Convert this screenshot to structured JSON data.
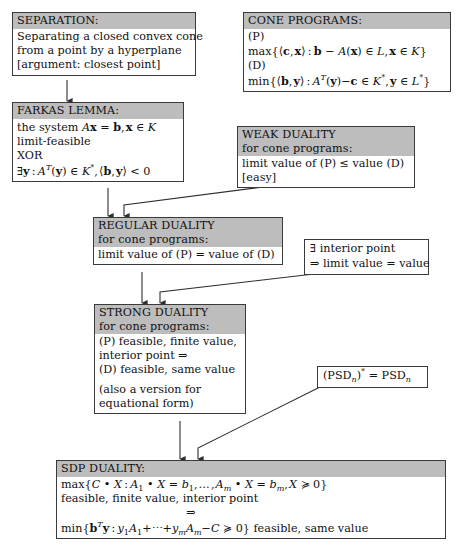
{
  "diagram": {
    "box_fill": "#ffffff",
    "header_fill": "#bdbdbd",
    "border_color": "#3a3a3a"
  },
  "boxes": {
    "separation": {
      "header": "SEPARATION:",
      "lines": [
        "Separating a closed convex cone",
        "from a point by a hyperplane",
        "[argument: closest point]"
      ]
    },
    "cone_programs": {
      "header": "CONE PROGRAMS:",
      "lines": [
        "(P)",
        "max{⟨c, x⟩ : b − A(x) ∈ L, x ∈ K}",
        "(D)",
        "min{⟨b, y⟩ : A^T(y)−c ∈ K*, y ∈ L*}"
      ]
    },
    "farkas": {
      "header": "FARKAS LEMMA:",
      "lines": [
        "the system Ax = b, x ∈ K",
        "limit-feasible",
        "XOR",
        "∃y : A^T(y) ∈ K*, ⟨b, y⟩ < 0"
      ]
    },
    "weak_duality": {
      "header_line1": "WEAK DUALITY",
      "header_line2": "for cone programs:",
      "lines": [
        "limit value of (P) ≤ value (D)",
        "[easy]"
      ]
    },
    "regular_duality": {
      "header_line1": "REGULAR DUALITY",
      "header_line2": "for cone programs:",
      "lines": [
        "limit value of (P) = value of (D)"
      ]
    },
    "interior_point": {
      "lines": [
        "∃ interior point",
        "⇒ limit value = value"
      ]
    },
    "strong_duality": {
      "header_line1": "STRONG DUALITY",
      "header_line2": "for cone programs:",
      "lines": [
        "(P) feasible, finite value,",
        "interior point ⇒",
        "(D) feasible, same value",
        "",
        "(also a version for",
        "equational form)"
      ]
    },
    "psd_selfdual": {
      "lines": [
        "(PSD_n)* = PSD_n"
      ]
    },
    "sdp_duality": {
      "header": "SDP DUALITY:",
      "lines": [
        "max{C • X : A_1 • X = b_1, …, A_m • X = b_m, X ⪰ 0}",
        "feasible, finite value, interior point",
        "⇒",
        "min{b^T y : y_1 A_1 + ⋯ + y_m A_m − C ⪰ 0} feasible, same value"
      ]
    }
  },
  "edges": [
    {
      "name": "separation-to-farkas",
      "from": "separation",
      "to": "farkas"
    },
    {
      "name": "farkas-to-regular",
      "from": "farkas",
      "to": "regular_duality"
    },
    {
      "name": "weak-to-regular",
      "from": "weak_duality",
      "to": "regular_duality"
    },
    {
      "name": "regular-to-strong",
      "from": "regular_duality",
      "to": "strong_duality"
    },
    {
      "name": "interior-to-strong",
      "from": "interior_point",
      "to": "strong_duality"
    },
    {
      "name": "strong-to-sdp",
      "from": "strong_duality",
      "to": "sdp_duality"
    },
    {
      "name": "psd-to-sdp",
      "from": "psd_selfdual",
      "to": "sdp_duality"
    }
  ]
}
